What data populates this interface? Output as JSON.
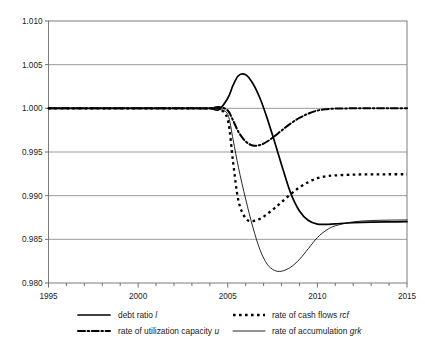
{
  "chart_data": {
    "type": "line",
    "title": "",
    "xlabel": "",
    "ylabel": "",
    "xlim": [
      1995,
      2015
    ],
    "ylim": [
      0.98,
      1.01
    ],
    "grid": true,
    "legend_position": "bottom",
    "y_ticks": [
      "0.980",
      "0.985",
      "0.990",
      "0.995",
      "1.000",
      "1.005",
      "1.010"
    ],
    "x_ticks": [
      "1995",
      "2000",
      "2005",
      "2010",
      "2015"
    ],
    "x_minor_tick_interval": 1,
    "x": [
      1995,
      1996,
      1997,
      1998,
      1999,
      2000,
      2001,
      2002,
      2003,
      2004,
      2004.5,
      2005,
      2005.3,
      2005.6,
      2006,
      2006.4,
      2006.8,
      2007.2,
      2007.6,
      2008,
      2008.5,
      2009,
      2009.5,
      2010,
      2010.5,
      2011,
      2012,
      2013,
      2014,
      2015
    ],
    "series": [
      {
        "name": "debt ratio l",
        "key": "l",
        "style": "solid",
        "width": 1.7,
        "color": "#000000",
        "values": [
          1.0,
          1.0,
          1.0,
          1.0,
          1.0,
          1.0,
          1.0,
          1.0,
          1.0,
          1.0,
          0.99985,
          1.00115,
          1.00265,
          1.00375,
          1.00385,
          1.00285,
          1.00115,
          0.99885,
          0.99625,
          0.99355,
          0.99035,
          0.98825,
          0.98715,
          0.98675,
          0.98672,
          0.98678,
          0.9869,
          0.98697,
          0.987,
          0.98702
        ]
      },
      {
        "name": "rate of cash flows rcf",
        "key": "rcf",
        "style": "dotted",
        "width": 2.3,
        "color": "#000000",
        "values": [
          1.0,
          1.0,
          1.0,
          1.0,
          1.0,
          1.0,
          1.0,
          1.0,
          1.0,
          1.0,
          0.99995,
          0.9987,
          0.9938,
          0.9894,
          0.9874,
          0.9871,
          0.98735,
          0.9879,
          0.98855,
          0.98925,
          0.99015,
          0.99095,
          0.99155,
          0.992,
          0.99222,
          0.99232,
          0.99241,
          0.99244,
          0.99245,
          0.99245
        ]
      },
      {
        "name": "rate of utilization capacity u",
        "key": "u",
        "style": "dashdot",
        "width": 2.0,
        "color": "#000000",
        "values": [
          1.0,
          1.0,
          1.0,
          1.0,
          1.0,
          1.0,
          1.0,
          1.0,
          1.0,
          1.0,
          1.00015,
          0.99975,
          0.9986,
          0.9973,
          0.9962,
          0.99575,
          0.9958,
          0.9962,
          0.9968,
          0.99745,
          0.99825,
          0.9989,
          0.9994,
          0.99975,
          0.9999,
          0.99997,
          1.0,
          1.0,
          1.0,
          1.0
        ]
      },
      {
        "name": "rate of accumulation grk",
        "key": "grk",
        "style": "solid",
        "width": 0.85,
        "color": "#000000",
        "values": [
          1.0,
          1.0,
          1.0,
          1.0,
          1.0,
          1.0,
          1.0,
          1.0,
          1.0,
          1.0,
          0.9999,
          0.9993,
          0.9964,
          0.9932,
          0.9896,
          0.9864,
          0.9838,
          0.98215,
          0.98145,
          0.98135,
          0.9818,
          0.9827,
          0.98395,
          0.9852,
          0.98605,
          0.98655,
          0.987,
          0.98715,
          0.9872,
          0.98722
        ]
      }
    ]
  },
  "legend": {
    "items": [
      {
        "label_plain": "debt ratio ",
        "label_italic": "l",
        "style": "solid"
      },
      {
        "label_plain": "rate of cash flows ",
        "label_italic": "rcf",
        "style": "dotted"
      },
      {
        "label_plain": "rate of utilization capacity ",
        "label_italic": "u",
        "style": "dashdot"
      },
      {
        "label_plain": "rate of accumulation ",
        "label_italic": "grk",
        "style": "thin-solid"
      }
    ]
  }
}
